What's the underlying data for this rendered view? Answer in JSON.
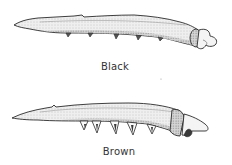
{
  "figure": {
    "type": "illustration",
    "items": [
      {
        "id": "black",
        "label": "Black",
        "subject": "larva",
        "orientation": "head-right"
      },
      {
        "id": "brown",
        "label": "Brown",
        "subject": "larva",
        "orientation": "head-right"
      }
    ]
  },
  "colors": {
    "background": "#ffffff",
    "ink": "#2a2a2a",
    "body_fill": "#ececec",
    "shading": "#bdbdbd",
    "label_text": "#333333"
  }
}
